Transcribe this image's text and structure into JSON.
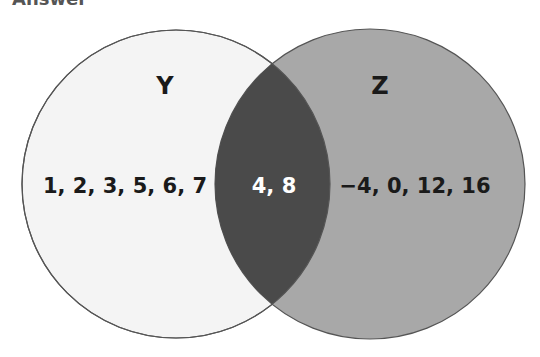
{
  "header": {
    "title": "Answer"
  },
  "diagram": {
    "type": "venn",
    "sets": [
      {
        "name": "Y",
        "only_elements": "1, 2, 3, 5, 6, 7",
        "fill": "#f4f4f4"
      },
      {
        "name": "Z",
        "only_elements": "−4, 0, 12, 16",
        "fill": "#a8a8a8"
      }
    ],
    "intersection": {
      "elements": "4, 8",
      "fill": "#4a4a4a"
    }
  }
}
